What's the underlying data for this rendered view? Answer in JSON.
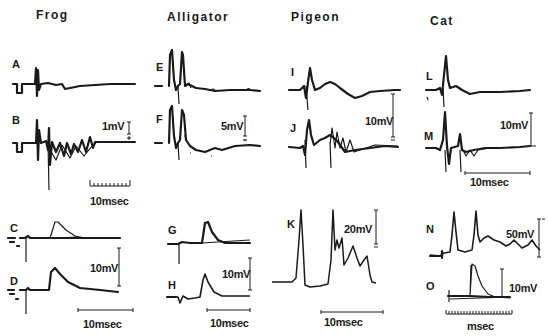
{
  "columns": [
    {
      "species": "Frog"
    },
    {
      "species": "Alligator"
    },
    {
      "species": "Pigeon"
    },
    {
      "species": "Cat"
    }
  ],
  "panels": {
    "A": "A",
    "B": "B",
    "C": "C",
    "D": "D",
    "E": "E",
    "F": "F",
    "G": "G",
    "H": "H",
    "I": "I",
    "J": "J",
    "K": "K",
    "L": "L",
    "M": "M",
    "N": "N",
    "O": "O"
  },
  "scales": {
    "frog_top_voltage": "1mV",
    "frog_top_time": "10msec",
    "frog_bottom_voltage": "10mV",
    "frog_bottom_time": "10msec",
    "alligator_top_voltage": "5mV",
    "alligator_bottom_voltage": "10mV",
    "alligator_bottom_time": "10msec",
    "pigeon_top_voltage": "10mV",
    "pigeon_bottom_voltage": "20mV",
    "pigeon_bottom_time": "10msec",
    "cat_top_voltage": "10mV",
    "cat_top_time": "10msec",
    "cat_N_voltage": "50mV",
    "cat_O_voltage": "10mV",
    "cat_O_time": "msec"
  },
  "colors": {
    "trace": "#1a1a1a",
    "background": "#ffffff"
  }
}
